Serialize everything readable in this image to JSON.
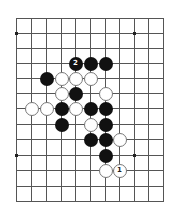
{
  "board": {
    "cols": 11,
    "rows": 13,
    "col_x": [
      16,
      31,
      46,
      61,
      75,
      90,
      105,
      119,
      134,
      148,
      163
    ],
    "row_y": [
      18,
      33,
      48,
      63,
      78,
      93,
      108,
      124,
      139,
      155,
      170,
      186,
      201
    ],
    "line_color": "#555555",
    "star_points": [
      [
        0,
        1
      ],
      [
        8,
        1
      ],
      [
        0,
        9
      ],
      [
        8,
        9
      ]
    ]
  },
  "stones": [
    {
      "color": "black",
      "col": 4,
      "row": 3,
      "label": "2"
    },
    {
      "color": "black",
      "col": 5,
      "row": 3,
      "label": ""
    },
    {
      "color": "black",
      "col": 6,
      "row": 3,
      "label": ""
    },
    {
      "color": "black",
      "col": 2,
      "row": 4,
      "label": ""
    },
    {
      "color": "white",
      "col": 3,
      "row": 4,
      "label": ""
    },
    {
      "color": "white",
      "col": 4,
      "row": 4,
      "label": ""
    },
    {
      "color": "white",
      "col": 5,
      "row": 4,
      "label": ""
    },
    {
      "color": "white",
      "col": 3,
      "row": 5,
      "label": ""
    },
    {
      "color": "black",
      "col": 4,
      "row": 5,
      "label": ""
    },
    {
      "color": "white",
      "col": 6,
      "row": 5,
      "label": ""
    },
    {
      "color": "white",
      "col": 1,
      "row": 6,
      "label": ""
    },
    {
      "color": "white",
      "col": 2,
      "row": 6,
      "label": ""
    },
    {
      "color": "black",
      "col": 3,
      "row": 6,
      "label": ""
    },
    {
      "color": "white",
      "col": 4,
      "row": 6,
      "label": ""
    },
    {
      "color": "black",
      "col": 5,
      "row": 6,
      "label": ""
    },
    {
      "color": "black",
      "col": 6,
      "row": 6,
      "label": ""
    },
    {
      "color": "black",
      "col": 3,
      "row": 7,
      "label": ""
    },
    {
      "color": "white",
      "col": 5,
      "row": 7,
      "label": ""
    },
    {
      "color": "black",
      "col": 6,
      "row": 7,
      "label": ""
    },
    {
      "color": "black",
      "col": 5,
      "row": 8,
      "label": ""
    },
    {
      "color": "black",
      "col": 6,
      "row": 8,
      "label": ""
    },
    {
      "color": "white",
      "col": 7,
      "row": 8,
      "label": ""
    },
    {
      "color": "black",
      "col": 6,
      "row": 9,
      "label": ""
    },
    {
      "color": "white",
      "col": 6,
      "row": 10,
      "label": ""
    },
    {
      "color": "white",
      "col": 7,
      "row": 10,
      "label": "1"
    }
  ]
}
